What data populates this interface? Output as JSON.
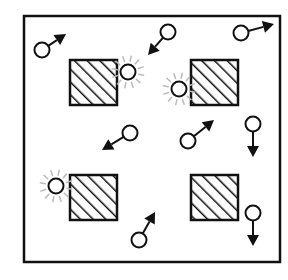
{
  "diagram": {
    "width": 288,
    "height": 280,
    "colors": {
      "ink": "#111111",
      "glow": "#bbbbbb",
      "background": "#ffffff"
    },
    "box": {
      "x": 24,
      "y": 16,
      "w": 256,
      "h": 246
    },
    "obstacles": [
      {
        "id": "top-left",
        "x": 70,
        "y": 60,
        "w": 47,
        "h": 45
      },
      {
        "id": "top-right",
        "x": 191,
        "y": 60,
        "w": 47,
        "h": 45
      },
      {
        "id": "bottom-left",
        "x": 70,
        "y": 175,
        "w": 47,
        "h": 45
      },
      {
        "id": "bottom-right",
        "x": 191,
        "y": 175,
        "w": 47,
        "h": 45
      }
    ],
    "particles": [
      {
        "id": "p1",
        "cx": 42,
        "cy": 50,
        "tx": 66,
        "ty": 34,
        "glow": false
      },
      {
        "id": "p2",
        "cx": 168,
        "cy": 32,
        "tx": 148,
        "ty": 55,
        "glow": false
      },
      {
        "id": "p3",
        "cx": 241,
        "cy": 33,
        "tx": 274,
        "ty": 24,
        "glow": false
      },
      {
        "id": "p4",
        "cx": 128,
        "cy": 72,
        "glow": true
      },
      {
        "id": "p5",
        "cx": 179,
        "cy": 89,
        "glow": true
      },
      {
        "id": "p6",
        "cx": 130,
        "cy": 133,
        "tx": 102,
        "ty": 150,
        "glow": false
      },
      {
        "id": "p7",
        "cx": 188,
        "cy": 141,
        "tx": 214,
        "ty": 120,
        "glow": false
      },
      {
        "id": "p8",
        "cx": 253,
        "cy": 124,
        "tx": 253,
        "ty": 157,
        "glow": false
      },
      {
        "id": "p9",
        "cx": 56,
        "cy": 186,
        "glow": true
      },
      {
        "id": "p10",
        "cx": 139,
        "cy": 240,
        "tx": 155,
        "ty": 212,
        "glow": false
      },
      {
        "id": "p11",
        "cx": 253,
        "cy": 213,
        "tx": 253,
        "ty": 246,
        "glow": false
      }
    ]
  }
}
